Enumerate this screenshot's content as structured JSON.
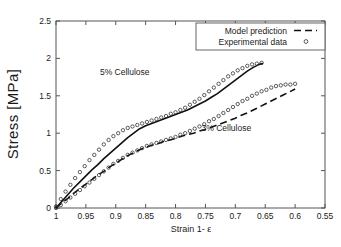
{
  "chart_data": {
    "type": "line",
    "title": "",
    "xlabel": "Strain 1- ε",
    "ylabel": "Stress  [MPa]",
    "xlim": [
      1.0,
      0.55
    ],
    "ylim": [
      0,
      2.5
    ],
    "x_reversed": true,
    "grid": false,
    "legend_position": "top-right",
    "xticks": [
      "1",
      "0.95",
      "0.9",
      "0.85",
      "0.8",
      "0.75",
      "0.7",
      "0.65",
      "0.6",
      "0.55"
    ],
    "xtick_values": [
      1.0,
      0.95,
      0.9,
      0.85,
      0.8,
      0.75,
      0.7,
      0.65,
      0.6,
      0.55
    ],
    "yticks": [
      "0",
      "0.5",
      "1",
      "1.5",
      "2",
      "2.5"
    ],
    "ytick_values": [
      0,
      0.5,
      1.0,
      1.5,
      2.0,
      2.5
    ],
    "legend": [
      {
        "label": "Model prediction",
        "marker": "dashed-line"
      },
      {
        "label": "Experimental data",
        "marker": "open-circle"
      }
    ],
    "annotations": [
      {
        "text": "5% Cellulose",
        "x": 0.885,
        "y": 1.78
      },
      {
        "text": "3% Cellulose",
        "x": 0.715,
        "y": 1.03
      }
    ],
    "series": [
      {
        "name": "5% Cellulose - Model prediction",
        "style": "solid",
        "x": [
          1.0,
          0.99,
          0.98,
          0.97,
          0.96,
          0.95,
          0.94,
          0.93,
          0.92,
          0.91,
          0.9,
          0.89,
          0.88,
          0.87,
          0.86,
          0.85,
          0.84,
          0.83,
          0.82,
          0.81,
          0.8,
          0.79,
          0.78,
          0.77,
          0.76,
          0.75,
          0.74,
          0.73,
          0.72,
          0.71,
          0.7,
          0.69,
          0.68,
          0.67,
          0.66,
          0.655
        ],
        "y": [
          0.0,
          0.09,
          0.18,
          0.27,
          0.35,
          0.43,
          0.51,
          0.58,
          0.66,
          0.73,
          0.8,
          0.87,
          0.94,
          1.0,
          1.06,
          1.1,
          1.13,
          1.16,
          1.19,
          1.22,
          1.25,
          1.28,
          1.31,
          1.35,
          1.39,
          1.43,
          1.48,
          1.53,
          1.59,
          1.65,
          1.71,
          1.77,
          1.83,
          1.88,
          1.92,
          1.93
        ]
      },
      {
        "name": "5% Cellulose - Experimental data",
        "style": "circles",
        "x": [
          1.0,
          0.992,
          0.984,
          0.976,
          0.968,
          0.96,
          0.952,
          0.944,
          0.936,
          0.928,
          0.92,
          0.912,
          0.904,
          0.896,
          0.888,
          0.88,
          0.872,
          0.864,
          0.856,
          0.848,
          0.84,
          0.832,
          0.824,
          0.816,
          0.808,
          0.8,
          0.792,
          0.784,
          0.776,
          0.768,
          0.76,
          0.752,
          0.744,
          0.736,
          0.728,
          0.72,
          0.712,
          0.704,
          0.696,
          0.688,
          0.68,
          0.672,
          0.664,
          0.656
        ],
        "y": [
          0.02,
          0.12,
          0.22,
          0.31,
          0.4,
          0.48,
          0.56,
          0.64,
          0.71,
          0.78,
          0.85,
          0.91,
          0.96,
          1.0,
          1.04,
          1.07,
          1.09,
          1.11,
          1.13,
          1.15,
          1.17,
          1.19,
          1.21,
          1.23,
          1.26,
          1.28,
          1.31,
          1.34,
          1.38,
          1.42,
          1.46,
          1.51,
          1.56,
          1.61,
          1.66,
          1.71,
          1.76,
          1.8,
          1.84,
          1.87,
          1.9,
          1.92,
          1.93,
          1.94
        ]
      },
      {
        "name": "3% Cellulose - Model prediction",
        "style": "dashed",
        "x": [
          1.0,
          0.99,
          0.98,
          0.97,
          0.96,
          0.95,
          0.94,
          0.93,
          0.92,
          0.91,
          0.9,
          0.89,
          0.88,
          0.87,
          0.86,
          0.85,
          0.84,
          0.83,
          0.82,
          0.81,
          0.8,
          0.79,
          0.78,
          0.77,
          0.76,
          0.75,
          0.74,
          0.73,
          0.72,
          0.71,
          0.7,
          0.69,
          0.68,
          0.67,
          0.66,
          0.65,
          0.64,
          0.63,
          0.62,
          0.61,
          0.6
        ],
        "y": [
          0.0,
          0.07,
          0.13,
          0.2,
          0.26,
          0.32,
          0.38,
          0.44,
          0.49,
          0.55,
          0.6,
          0.65,
          0.7,
          0.74,
          0.78,
          0.81,
          0.84,
          0.86,
          0.89,
          0.91,
          0.93,
          0.96,
          0.98,
          1.0,
          1.03,
          1.05,
          1.08,
          1.11,
          1.14,
          1.17,
          1.2,
          1.24,
          1.27,
          1.31,
          1.35,
          1.39,
          1.43,
          1.47,
          1.51,
          1.55,
          1.59
        ]
      },
      {
        "name": "3% Cellulose - Experimental data",
        "style": "circles",
        "x": [
          1.0,
          0.992,
          0.984,
          0.976,
          0.968,
          0.96,
          0.952,
          0.944,
          0.936,
          0.928,
          0.92,
          0.912,
          0.904,
          0.896,
          0.888,
          0.88,
          0.872,
          0.864,
          0.856,
          0.848,
          0.84,
          0.832,
          0.824,
          0.816,
          0.808,
          0.8,
          0.792,
          0.784,
          0.776,
          0.768,
          0.76,
          0.752,
          0.744,
          0.736,
          0.728,
          0.72,
          0.712,
          0.704,
          0.696,
          0.688,
          0.68,
          0.672,
          0.664,
          0.656,
          0.648,
          0.64,
          0.632,
          0.624,
          0.616,
          0.608,
          0.6
        ],
        "y": [
          0.0,
          0.04,
          0.09,
          0.14,
          0.19,
          0.24,
          0.29,
          0.34,
          0.39,
          0.44,
          0.49,
          0.54,
          0.59,
          0.63,
          0.67,
          0.71,
          0.74,
          0.77,
          0.8,
          0.83,
          0.85,
          0.87,
          0.89,
          0.91,
          0.93,
          0.95,
          0.98,
          1.0,
          1.03,
          1.06,
          1.09,
          1.12,
          1.16,
          1.19,
          1.23,
          1.27,
          1.31,
          1.35,
          1.39,
          1.43,
          1.46,
          1.5,
          1.53,
          1.56,
          1.58,
          1.61,
          1.63,
          1.64,
          1.65,
          1.65,
          1.66
        ]
      }
    ]
  }
}
